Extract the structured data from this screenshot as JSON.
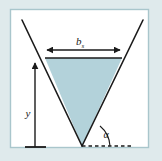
{
  "figure": {
    "kind": "geometry-diagram",
    "canvas": {
      "width": 162,
      "height": 161
    },
    "colors": {
      "outer_background": "#dfeaec",
      "panel_background": "#ffffff",
      "panel_border": "#a9c6cc",
      "triangle_fill": "#b3d2da",
      "line_stroke": "#1a1a1a",
      "label_color": "#1a1a1a"
    },
    "panel": {
      "x": 10,
      "y": 9,
      "width": 139,
      "height": 139
    },
    "labels": {
      "top_width": {
        "base": "b",
        "subscript": "s",
        "text": "bs",
        "x": 84,
        "y": 44
      },
      "depth": {
        "base": "y",
        "subscript": "",
        "text": "y",
        "x": 28,
        "y": 116
      },
      "angle": {
        "base": "α",
        "subscript": "",
        "text": "α",
        "x": 105,
        "y": 137
      }
    },
    "geometry": {
      "apex": {
        "x": 82,
        "y": 146
      },
      "chord_left": {
        "x": 45,
        "y": 58
      },
      "chord_right": {
        "x": 122,
        "y": 58
      },
      "v_left_top": {
        "x": 22,
        "y": 20
      },
      "v_right_top": {
        "x": 143,
        "y": 20
      },
      "dimension_arrow_y": 50,
      "dimension_arrow_x1": 46,
      "dimension_arrow_x2": 121,
      "depth_arrow_x": 35,
      "depth_arrow_top_y": 61,
      "depth_arrow_bottom_y": 147,
      "baseline_tick_x1": 25,
      "baseline_tick_x2": 45,
      "baseline_tick_y": 147,
      "dashed_line_x1": 82,
      "dashed_line_x2": 133,
      "dashed_line_y": 146
    }
  }
}
